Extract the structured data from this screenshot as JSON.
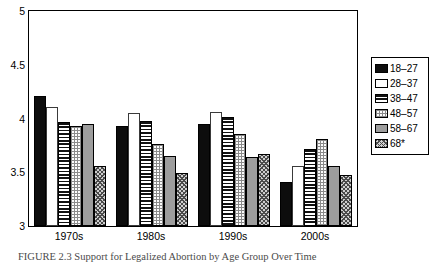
{
  "chart_data": {
    "type": "bar",
    "title": "",
    "xlabel": "",
    "ylabel": "",
    "ylim": [
      3,
      5
    ],
    "yticks": [
      "3",
      "3.5",
      "4",
      "4.5",
      "5"
    ],
    "ytick_values": [
      3,
      3.5,
      4,
      4.5,
      5
    ],
    "grid": false,
    "legend_position": "right",
    "categories": [
      "1970s",
      "1980s",
      "1990s",
      "2000s"
    ],
    "series": [
      {
        "name": "18–27",
        "pattern": "solid-black",
        "values": [
          4.21,
          3.93,
          3.95,
          3.41
        ]
      },
      {
        "name": "28–37",
        "pattern": "white",
        "values": [
          4.11,
          4.05,
          4.06,
          3.56
        ]
      },
      {
        "name": "38–47",
        "pattern": "h-stripe",
        "values": [
          3.97,
          3.98,
          4.01,
          3.72
        ]
      },
      {
        "name": "48–57",
        "pattern": "dots",
        "values": [
          3.93,
          3.76,
          3.86,
          3.81
        ]
      },
      {
        "name": "58–67",
        "pattern": "gray",
        "values": [
          3.95,
          3.65,
          3.64,
          3.56
        ]
      },
      {
        "name": "68*",
        "pattern": "cross",
        "values": [
          3.56,
          3.49,
          3.67,
          3.47
        ]
      }
    ]
  },
  "legend": {
    "entries": [
      {
        "label": "18–27"
      },
      {
        "label": "28–37"
      },
      {
        "label": "38–47"
      },
      {
        "label": "48–57"
      },
      {
        "label": "58–67"
      },
      {
        "label": "68*"
      }
    ]
  },
  "caption": {
    "text": "FIGURE 2.3 Support for Legalized Abortion by Age Group Over Time"
  }
}
